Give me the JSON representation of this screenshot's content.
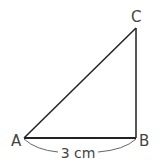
{
  "diagram": {
    "type": "right-triangle",
    "vertices": {
      "A": {
        "label": "A",
        "x": 24,
        "y": 138
      },
      "B": {
        "label": "B",
        "x": 136,
        "y": 138
      },
      "C": {
        "label": "C",
        "x": 136,
        "y": 28
      }
    },
    "measurement": {
      "label": "3 cm",
      "segment": "AB"
    },
    "colors": {
      "line": "#222222",
      "text": "#444444",
      "brace": "#666666",
      "background": "#ffffff"
    }
  }
}
